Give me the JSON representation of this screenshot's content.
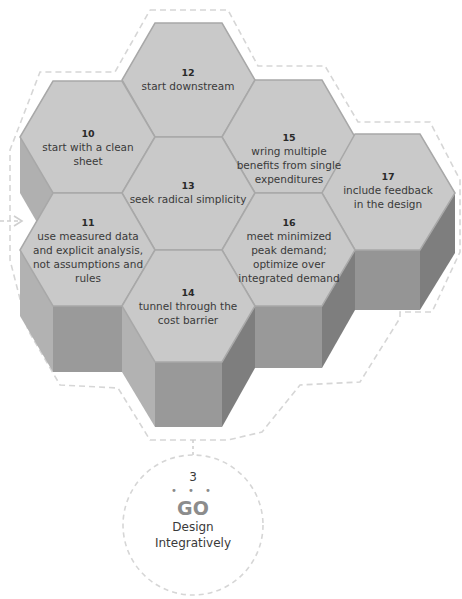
{
  "hexagons": [
    {
      "id": "10",
      "number": "10",
      "text": "start with a clean sheet"
    },
    {
      "id": "11",
      "number": "11",
      "text": "use measured data and explicit analysis, not assumptions and rules"
    },
    {
      "id": "12",
      "number": "12",
      "text": "start downstream"
    },
    {
      "id": "13",
      "number": "13",
      "text": "seek radical simplicity"
    },
    {
      "id": "14",
      "number": "14",
      "text": "tunnel through the cost barrier"
    },
    {
      "id": "15",
      "number": "15",
      "text": "wring multiple benefits from single expenditures"
    },
    {
      "id": "16",
      "number": "16",
      "text": "meet minimized peak demand; optimize over integrated demand"
    },
    {
      "id": "17",
      "number": "17",
      "text": "include feedback in the design"
    }
  ],
  "step": {
    "number": "3",
    "dots": "• • •",
    "title": "GO",
    "subtitle_line1": "Design",
    "subtitle_line2": "Integratively"
  },
  "colors": {
    "hex_top": "#c9c9c9",
    "side_light": "#b3b3b3",
    "side_front": "#999999",
    "side_dark": "#7e7e7e",
    "edge": "#a6a6a6",
    "dashed": "#d4d4d4",
    "go_text": "#8c8c8c"
  }
}
